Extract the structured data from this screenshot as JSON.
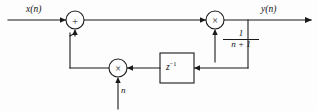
{
  "diagram": {
    "type": "block-diagram",
    "canvas": {
      "width": 317,
      "height": 111
    },
    "background_color": "#fdfdfd",
    "line_color": "#1a1a1a",
    "signals": {
      "input_label": "x(n)",
      "output_label": "y(n)",
      "modulator_label": "n"
    },
    "nodes": {
      "adder": {
        "glyph": "+",
        "name": "summing-junction"
      },
      "gain_multiplier": {
        "glyph": "×",
        "name": "forward-multiplier"
      },
      "feedback_multiplier": {
        "glyph": "×",
        "name": "feedback-multiplier"
      },
      "delay": {
        "label": "z",
        "exponent": "−1",
        "name": "unit-delay"
      }
    },
    "gain": {
      "numerator": "1",
      "denominator": "n + 1",
      "expression": "1/(n + 1)"
    }
  }
}
